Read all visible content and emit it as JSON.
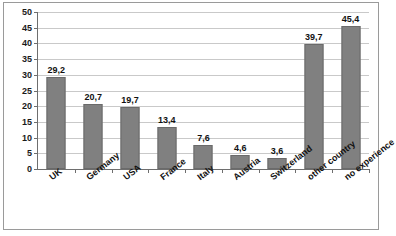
{
  "chart_data": {
    "type": "bar",
    "title": "",
    "subtitle": "",
    "xlabel": "",
    "ylabel": "",
    "ylim": [
      0,
      50
    ],
    "ytick_step": 5,
    "yticks": [
      "0",
      "5",
      "10",
      "15",
      "20",
      "25",
      "30",
      "35",
      "40",
      "45",
      "50"
    ],
    "grid": true,
    "legend": "none",
    "decimal_separator": ",",
    "categories": [
      "UK",
      "Germany",
      "USA",
      "France",
      "Italy",
      "Austria",
      "Switzerland",
      "other country",
      "no experience"
    ],
    "values": [
      29.2,
      20.7,
      19.7,
      13.4,
      7.6,
      4.6,
      3.6,
      39.7,
      45.4
    ],
    "value_labels": [
      "29,2",
      "20,7",
      "19,7",
      "13,4",
      "7,6",
      "4,6",
      "3,6",
      "39,7",
      "45,4"
    ],
    "bar_color": "#808080",
    "gridline_color": "#c9c9c9",
    "axis_color": "#6e6e6e",
    "background_color": "#ffffff"
  }
}
